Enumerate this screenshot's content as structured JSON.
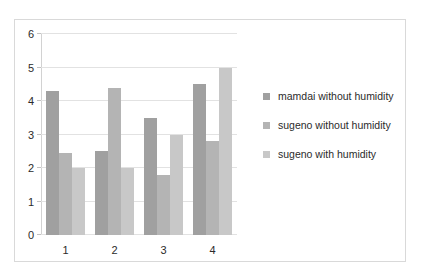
{
  "chart_data": {
    "type": "bar",
    "title": "",
    "xlabel": "",
    "ylabel": "",
    "categories": [
      "1",
      "2",
      "3",
      "4"
    ],
    "ylim": [
      0,
      6
    ],
    "y_ticks": [
      0,
      1,
      2,
      3,
      4,
      5,
      6
    ],
    "grid": true,
    "legend_position": "right",
    "series": [
      {
        "name": "mamdai without humidity",
        "color": "#a0a0a0",
        "values": [
          4.3,
          2.5,
          3.5,
          4.5
        ]
      },
      {
        "name": "sugeno without humidity",
        "color": "#b4b4b4",
        "values": [
          2.45,
          4.4,
          1.8,
          2.8
        ]
      },
      {
        "name": "sugeno with humidity",
        "color": "#c8c8c8",
        "values": [
          2.0,
          2.0,
          3.0,
          5.0
        ]
      }
    ]
  }
}
